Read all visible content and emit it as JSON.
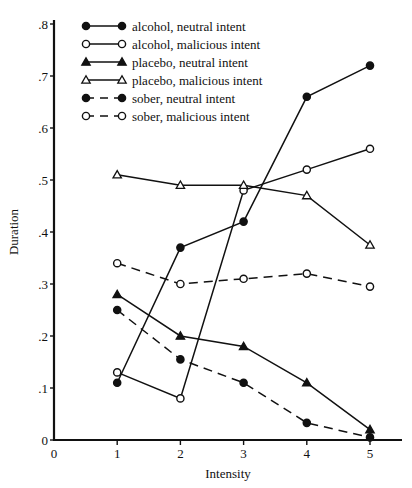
{
  "chart_data": {
    "type": "line",
    "title": "",
    "xlabel": "Intensity",
    "ylabel": "Duration",
    "x": [
      1,
      2,
      3,
      4,
      5
    ],
    "xlim": [
      0,
      5.5
    ],
    "ylim": [
      0,
      0.8
    ],
    "x_ticks": [
      0,
      1,
      2,
      3,
      4,
      5
    ],
    "x_tick_labels": [
      "0",
      "1",
      "2",
      "3",
      "4",
      "5"
    ],
    "y_ticks": [
      0,
      0.1,
      0.2,
      0.3,
      0.4,
      0.5,
      0.6,
      0.7,
      0.8
    ],
    "y_tick_labels": [
      "0",
      ".1",
      ".2",
      ".3",
      ".4",
      ".5",
      ".6",
      ".7",
      ".8"
    ],
    "grid": false,
    "legend_position": "upper left",
    "series": [
      {
        "name": "alcohol, neutral intent",
        "marker": "filled-circle",
        "dash": "solid",
        "values": [
          0.11,
          0.37,
          0.42,
          0.66,
          0.72
        ]
      },
      {
        "name": "alcohol, malicious intent",
        "marker": "open-circle",
        "dash": "solid",
        "values": [
          0.13,
          0.08,
          0.48,
          0.52,
          0.56
        ]
      },
      {
        "name": "placebo, neutral intent",
        "marker": "filled-triangle",
        "dash": "solid",
        "values": [
          0.28,
          0.2,
          0.18,
          0.11,
          0.02
        ]
      },
      {
        "name": "placebo, malicious intent",
        "marker": "open-triangle",
        "dash": "solid",
        "values": [
          0.51,
          0.49,
          0.49,
          0.47,
          0.375
        ]
      },
      {
        "name": "sober, neutral intent",
        "marker": "filled-circle",
        "dash": "dashed",
        "values": [
          0.25,
          0.155,
          0.11,
          0.033,
          0.005
        ]
      },
      {
        "name": "sober, malicious intent",
        "marker": "open-circle",
        "dash": "dashed",
        "values": [
          0.34,
          0.3,
          0.31,
          0.32,
          0.295
        ]
      }
    ]
  },
  "colors": {
    "ink": "#111111",
    "background": "#ffffff"
  }
}
